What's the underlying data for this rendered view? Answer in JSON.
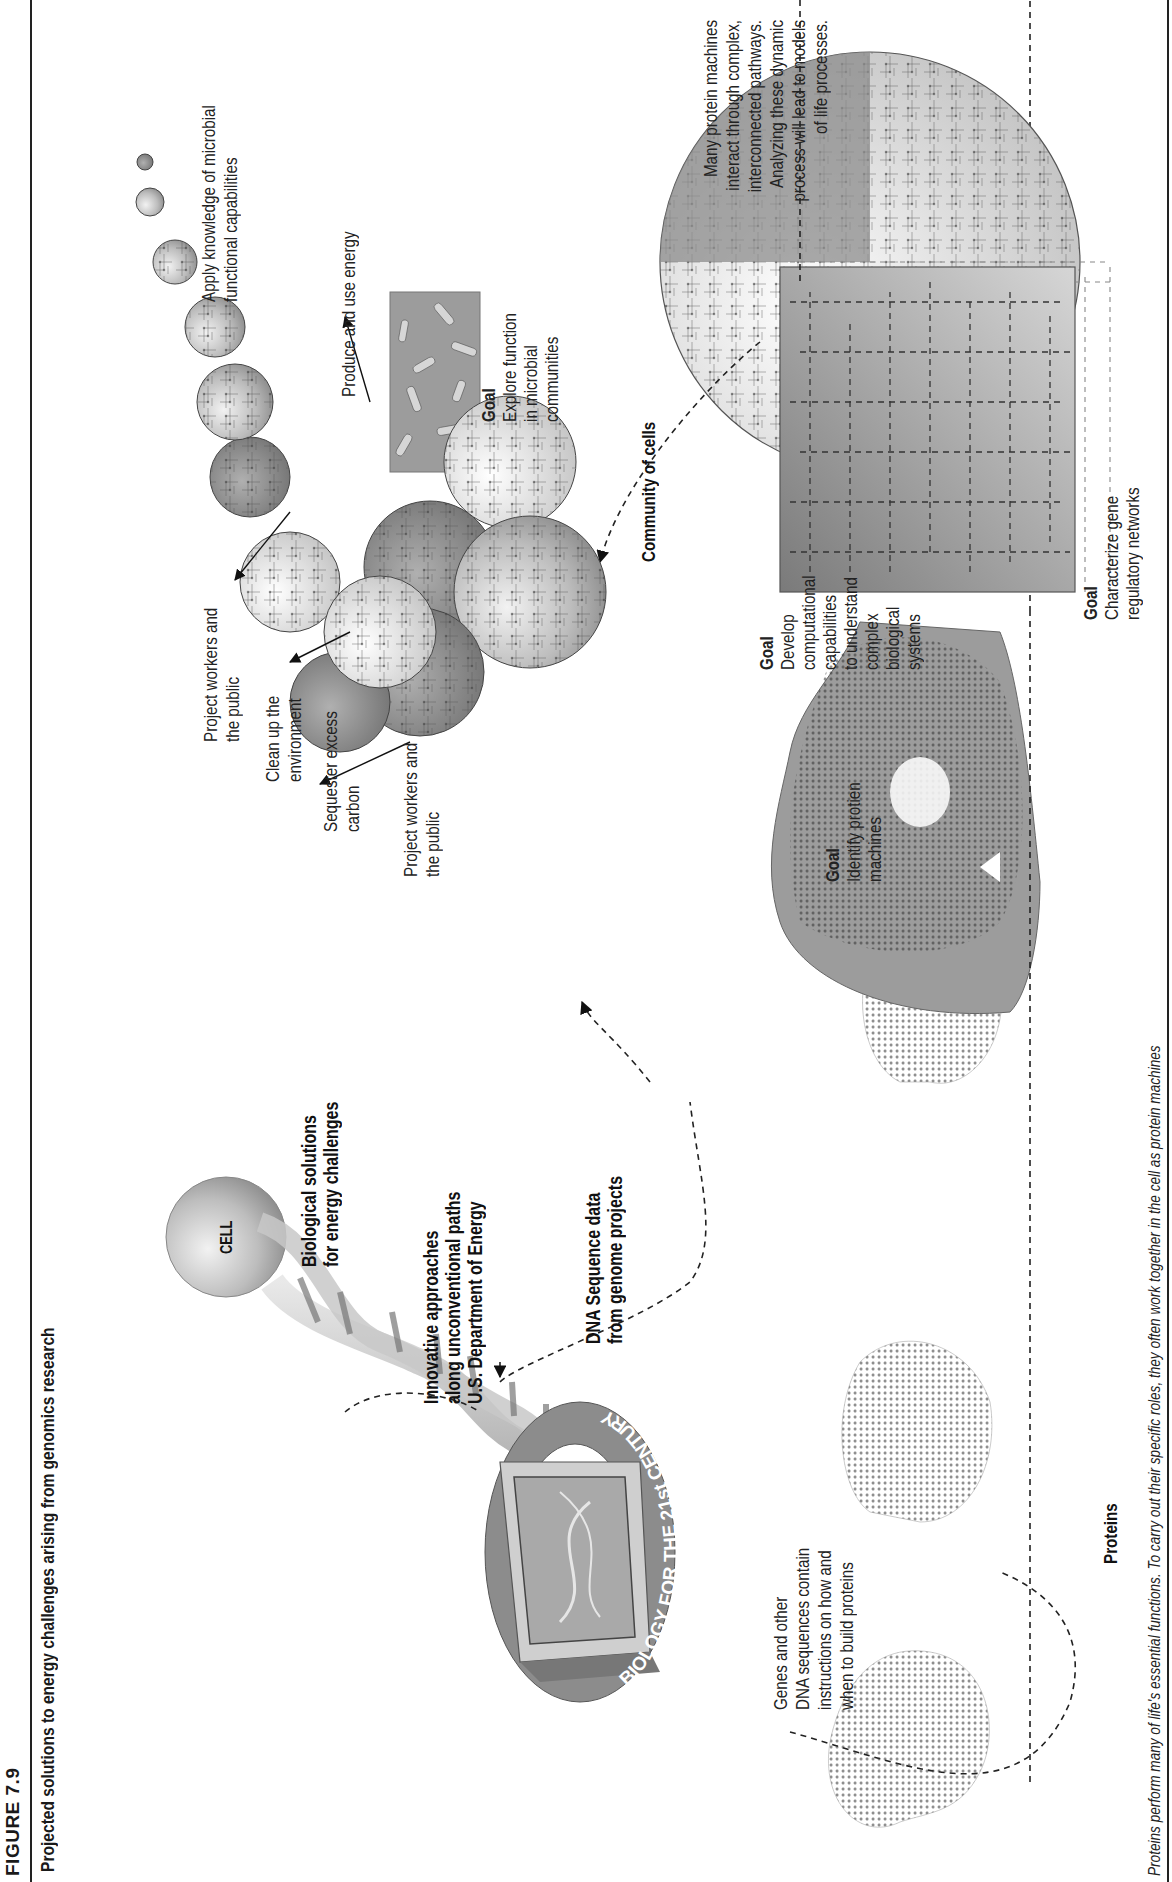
{
  "figure": {
    "label": "FIGURE 7.9",
    "title": "Projected solutions to energy challenges arising from genomics research"
  },
  "cell": {
    "label": "CELL"
  },
  "biology_ring": {
    "label": "BIOLOGY FOR THE 21st CENTURY"
  },
  "dna_bases": [
    "G",
    "C",
    "A",
    "T",
    "A",
    "C",
    "G",
    "T",
    "A",
    "C",
    "T",
    "C",
    "A"
  ],
  "headlines": {
    "biological_solutions": [
      "Biological solutions",
      "for energy challenges"
    ],
    "innovative": [
      "Innovative approaches",
      "along unconventional paths",
      "U.S. Department of Energy"
    ],
    "dna_sequence": [
      "DNA Sequence data",
      "from genome projects"
    ]
  },
  "genes_note": [
    "Genes and other",
    "DNA sequences contain",
    "instructions on how and",
    "when to build proteins"
  ],
  "proteins_label": "Proteins",
  "goals": {
    "protein_machines": {
      "heading": "Goal",
      "lines": [
        "Identify protien",
        "machines"
      ]
    },
    "gene_networks": {
      "heading": "Goal",
      "lines": [
        "Characterize gene",
        "regulatory networks"
      ]
    },
    "computational": {
      "heading": "Goal",
      "lines": [
        "Develop",
        "computational",
        "capabilities",
        "to understand",
        "complex",
        "biological",
        "systems"
      ]
    },
    "microbial": {
      "heading": "Goal",
      "lines": [
        "Explore function",
        "in microbial",
        "communities"
      ]
    }
  },
  "pathways_note": [
    "Many protein machines",
    "interact through complex,",
    "interconnected pathways.",
    "Analyzing these dynamic",
    "process will lead to models",
    "of life processes."
  ],
  "community_label": "Community of cells",
  "applications": {
    "apply_knowledge": [
      "Apply knowledge of microbial",
      "functional capabilities"
    ],
    "produce_energy": [
      "Produce and use energy"
    ],
    "project_workers_1": [
      "Project workers and",
      "the public"
    ],
    "clean_up": [
      "Clean up the",
      "environment"
    ],
    "sequester": [
      "Sequester excess",
      "carbon"
    ],
    "project_workers_2": [
      "Project workers and",
      "the public"
    ]
  },
  "caption": "Proteins perform many of life's essential functions. To carry out their specific roles, they often work together in the cell as protein machines",
  "colors": {
    "ink": "#1a1a1a",
    "sphere_light": "#d9d9d9",
    "sphere_mid": "#a8a8a8",
    "sphere_dark": "#7a7a7a",
    "panel": "#9a9a9a"
  }
}
